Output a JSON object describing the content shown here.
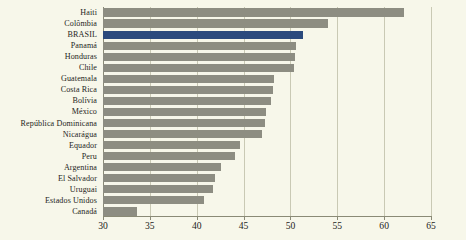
{
  "chart_data": {
    "type": "bar",
    "orientation": "horizontal",
    "title": "",
    "subtitle": "",
    "xlabel": "",
    "ylabel": "",
    "xlim": [
      30,
      65
    ],
    "ylim": null,
    "grid": true,
    "legend": null,
    "xticks": [
      30,
      35,
      40,
      45,
      50,
      55,
      60,
      65
    ],
    "highlight_category": "BRASIL",
    "colors": {
      "bar": "#8d8d82",
      "highlight_bar": "#2b4a7d",
      "background": "#f7f7ea",
      "gridline": "#c9c9b4",
      "axis": "#8a8a76",
      "text": "#25251c"
    },
    "categories": [
      "Haiti",
      "Colômbia",
      "BRASIL",
      "Panamá",
      "Honduras",
      "Chile",
      "Guatemala",
      "Costa Rica",
      "Bolívia",
      "México",
      "República Dominicana",
      "Nicarágua",
      "Equador",
      "Peru",
      "Argentina",
      "El Salvador",
      "Uruguai",
      "Estados Unidos",
      "Canadá"
    ],
    "values": [
      62.1,
      54.0,
      51.3,
      50.6,
      50.5,
      50.4,
      48.3,
      48.1,
      47.9,
      47.4,
      47.3,
      47.0,
      44.6,
      44.1,
      42.6,
      41.9,
      41.7,
      40.8,
      33.6
    ]
  }
}
